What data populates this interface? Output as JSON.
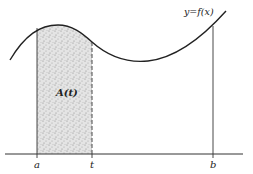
{
  "diagram": {
    "type": "area-under-curve",
    "curve_label": "y=f(x)",
    "area_label": "A(t)",
    "axis_labels": {
      "a": "a",
      "t": "t",
      "b": "b"
    },
    "colors": {
      "line": "#222222",
      "shade": "#cfcfcf",
      "background": "#ffffff"
    }
  }
}
